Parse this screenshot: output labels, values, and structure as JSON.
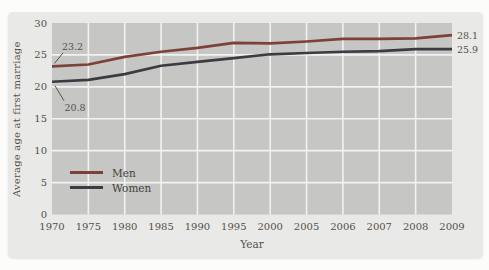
{
  "figure": {
    "page_background": "#fcfcfb",
    "panel_background": "#e9e9e7",
    "plot_background": "#c6c6c4",
    "gridline_color": "#f2f2f0",
    "text_color": "#54504b"
  },
  "chart_data": {
    "type": "line",
    "title": "",
    "xlabel": "Year",
    "ylabel": "Average age at first marriage",
    "categories": [
      "1970",
      "1975",
      "1980",
      "1985",
      "1990",
      "1995",
      "2000",
      "2005",
      "2006",
      "2007",
      "2008",
      "2009"
    ],
    "ylim": [
      0,
      30
    ],
    "yticks": [
      0,
      5,
      10,
      15,
      20,
      25,
      30
    ],
    "grid": true,
    "legend_position": "inside-bottom-left",
    "series": [
      {
        "name": "Men",
        "color": "#7c4138",
        "values": [
          23.2,
          23.5,
          24.7,
          25.5,
          26.1,
          26.9,
          26.8,
          27.1,
          27.5,
          27.5,
          27.6,
          28.1
        ]
      },
      {
        "name": "Women",
        "color": "#3f3a41",
        "values": [
          20.8,
          21.1,
          22.0,
          23.3,
          23.9,
          24.5,
          25.1,
          25.3,
          25.5,
          25.6,
          25.9,
          25.9
        ]
      }
    ],
    "annotations": [
      {
        "text": "23.2",
        "series": "Men",
        "point": "first"
      },
      {
        "text": "20.8",
        "series": "Women",
        "point": "first"
      },
      {
        "text": "28.1",
        "series": "Men",
        "point": "last"
      },
      {
        "text": "25.9",
        "series": "Women",
        "point": "last"
      }
    ]
  }
}
